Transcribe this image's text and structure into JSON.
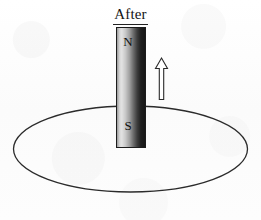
{
  "figure": {
    "title": "After",
    "background_color": "#fdfdfd",
    "outline_color": "#1c1c1c"
  },
  "magnet": {
    "north_label": "N",
    "south_label": "S",
    "gradient_light": "#e2e2e2",
    "gradient_dark": "#171717"
  },
  "arrow": {
    "direction": "up",
    "fill_color": "#ffffff",
    "stroke_color": "#2a2a2a"
  },
  "loop": {
    "shape": "ellipse",
    "stroke_color": "#2b2b2b"
  }
}
